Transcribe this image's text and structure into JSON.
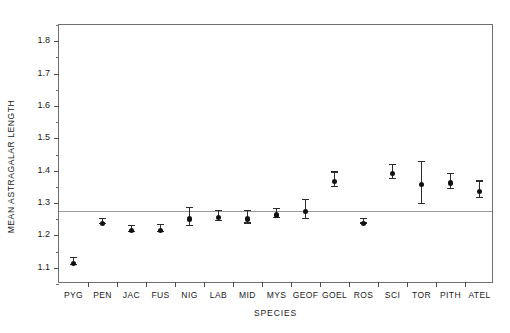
{
  "chart_data": {
    "type": "scatter",
    "title": "",
    "xlabel": "SPECIES",
    "ylabel": "MEAN ASTRAGALAR LENGTH",
    "ylim": [
      1.05,
      1.85
    ],
    "yticks": [
      1.1,
      1.2,
      1.3,
      1.4,
      1.5,
      1.6,
      1.7,
      1.8
    ],
    "ytick_labels": [
      "1.1",
      "1.2",
      "1.3",
      "1.4",
      "1.5",
      "1.6",
      "1.7",
      "1.8"
    ],
    "minor_ytick_interval": 0.05,
    "grid": false,
    "legend": "none",
    "reference_line": {
      "orientation": "horizontal",
      "value": 1.275,
      "color": "#9a9a9a"
    },
    "marker_style": "filled-circle-with-error-bars",
    "error_bar_type": "confidence-interval",
    "categories": [
      "PYG",
      "PEN",
      "JAC",
      "FUS",
      "NIG",
      "LAB",
      "MID",
      "MYS",
      "GEOF",
      "GOEL",
      "ROS",
      "SCI",
      "TOR",
      "PITH",
      "ATEL"
    ],
    "values": [
      1.122,
      1.245,
      1.224,
      1.224,
      1.259,
      1.263,
      1.259,
      1.271,
      1.283,
      1.375,
      1.246,
      1.4,
      1.365,
      1.37,
      1.344
    ],
    "error_low": [
      1.112,
      1.238,
      1.215,
      1.213,
      1.232,
      1.248,
      1.24,
      1.258,
      1.255,
      1.352,
      1.24,
      1.378,
      1.3,
      1.348,
      1.318
    ],
    "error_high": [
      1.133,
      1.253,
      1.233,
      1.236,
      1.288,
      1.28,
      1.278,
      1.285,
      1.313,
      1.398,
      1.253,
      1.421,
      1.429,
      1.392,
      1.37
    ]
  }
}
